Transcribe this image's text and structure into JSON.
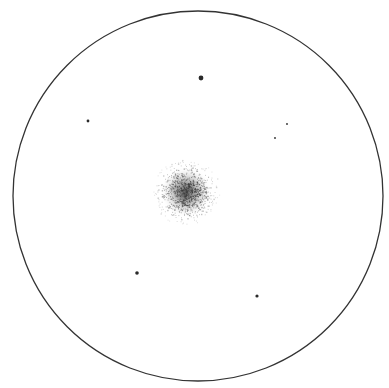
{
  "sketch": {
    "background": "#ffffff",
    "ink": "#2a2a2a",
    "field_of_view": {
      "cx": 198,
      "cy": 196,
      "r": 185,
      "stroke": "#333333",
      "stroke_width": 1.3
    },
    "cluster": {
      "cx": 186,
      "cy": 192,
      "core_r": 14,
      "halo_r": 34,
      "color": "#3a3a3a"
    },
    "stars": [
      {
        "x": 201,
        "y": 78,
        "r": 2.4
      },
      {
        "x": 88,
        "y": 121,
        "r": 1.4
      },
      {
        "x": 287,
        "y": 124,
        "r": 0.9
      },
      {
        "x": 275,
        "y": 138,
        "r": 0.9
      },
      {
        "x": 137,
        "y": 273,
        "r": 1.8
      },
      {
        "x": 257,
        "y": 296,
        "r": 1.6
      }
    ]
  }
}
